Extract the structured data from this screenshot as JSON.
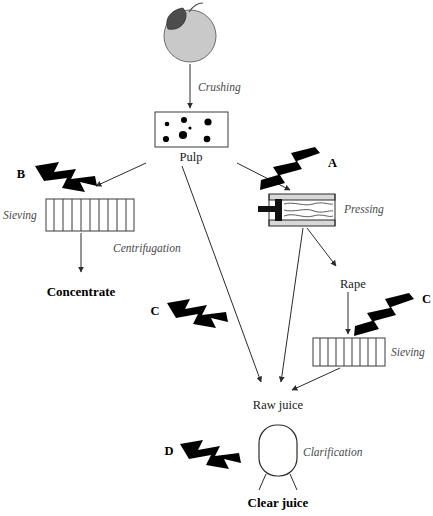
{
  "diagram": {
    "background_color": "#ffffff",
    "stroke_color": "#2b2b2b",
    "apple_fill": "#c9c9c9",
    "bolt_color": "#000000",
    "nodes": {
      "apple": "",
      "pulp": "Pulp",
      "concentrate": "Concentrate",
      "rape": "Rape",
      "raw_juice": "Raw juice",
      "clear_juice": "Clear juice"
    },
    "operations": {
      "crushing": "Crushing",
      "sieving_left": "Sieving",
      "pressing": "Pressing",
      "centrifugation": "Centrifugation",
      "sieving_right": "Sieving",
      "clarification": "Clarification"
    },
    "markers": {
      "b": "B",
      "a": "A",
      "c_left": "C",
      "c_right": "C",
      "d": "D"
    }
  }
}
